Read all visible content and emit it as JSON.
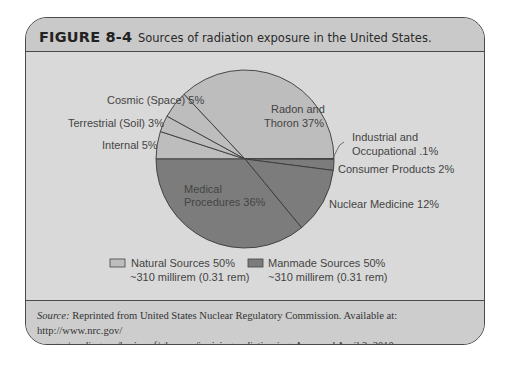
{
  "figure": {
    "number": "FIGURE 8-4",
    "title": "Sources of radiation exposure in the United States."
  },
  "source": {
    "label": "Source:",
    "text": " Reprinted from United States Nuclear Regulatory Commission. Available at: http://www.nrc.gov/",
    "text_line2": "images/reading-rm/basic-ref/glossary/ionizing-radiation.jpg. Accessed April 3, 2010."
  },
  "colors": {
    "natural": "#bdbdbd",
    "manmade": "#7c7c7c",
    "outline": "#3a3a3a"
  },
  "chart_data": {
    "type": "pie",
    "title": "Sources of radiation exposure in the United States.",
    "start_angle": "9 o'clock, clockwise",
    "slices": [
      {
        "label": "Internal",
        "value": 5,
        "group": "Natural"
      },
      {
        "label": "Terrestrial (Soil)",
        "value": 3,
        "group": "Natural"
      },
      {
        "label": "Cosmic (Space)",
        "value": 5,
        "group": "Natural"
      },
      {
        "label": "Radon and Thoron",
        "value": 37,
        "group": "Natural"
      },
      {
        "label": "Industrial and Occupational",
        "value": 0.1,
        "group": "Manmade"
      },
      {
        "label": "Consumer Products",
        "value": 2,
        "group": "Manmade"
      },
      {
        "label": "Nuclear Medicine",
        "value": 12,
        "group": "Manmade"
      },
      {
        "label": "Medical Procedures",
        "value": 36,
        "group": "Manmade"
      }
    ],
    "slice_labels": {
      "internal": "Internal 5%",
      "terrestrial": "Terrestrial (Soil) 3%",
      "cosmic": "Cosmic (Space) 5%",
      "radon_1": "Radon and",
      "radon_2": "Thoron 37%",
      "industrial_1": "Industrial and",
      "industrial_2": "Occupational .1%",
      "consumer": "Consumer Products 2%",
      "nuclear": "Nuclear Medicine 12%",
      "medical_1": "Medical",
      "medical_2": "Procedures 36%"
    },
    "legend": [
      {
        "name": "Natural Sources 50%",
        "sub": "~310 millirem (0.31 rem)",
        "color": "#bdbdbd"
      },
      {
        "name": "Manmade Sources 50%",
        "sub": "~310 millirem (0.31 rem)",
        "color": "#7c7c7c"
      }
    ],
    "legend_position": "bottom"
  }
}
